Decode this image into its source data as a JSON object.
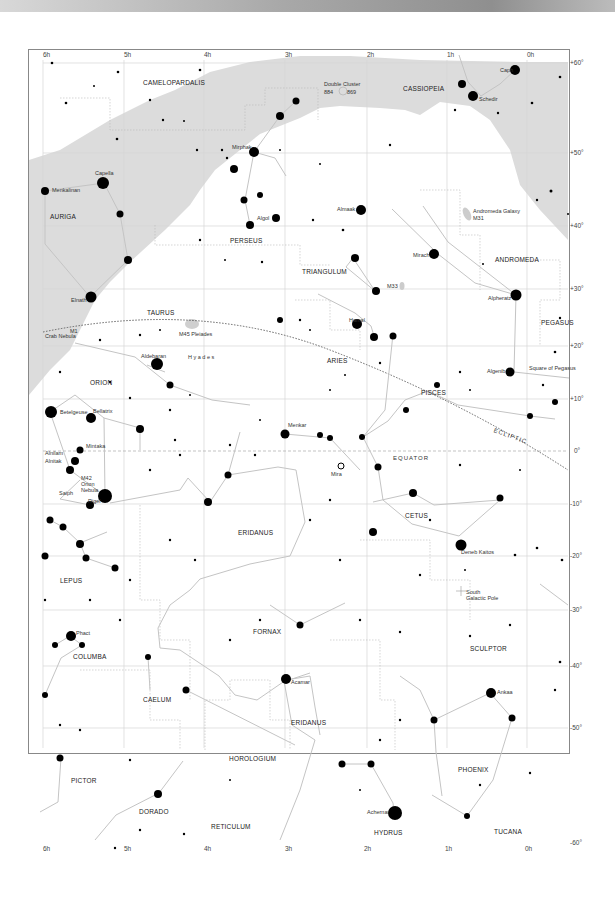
{
  "header": {
    "bar": ""
  },
  "ra_labels": [
    "6h",
    "5h",
    "4h",
    "3h",
    "2h",
    "1h",
    "0h"
  ],
  "dec_labels": [
    "+60°",
    "+50°",
    "+40°",
    "+30°",
    "+20°",
    "+10°",
    "0°",
    "-10°",
    "-20°",
    "-30°",
    "-40°",
    "-50°",
    "-60°"
  ],
  "constellations": {
    "camelopardalis": "CAMELOPARDALIS",
    "cassiopeia": "CASSIOPEIA",
    "auriga": "AURIGA",
    "perseus": "PERSEUS",
    "triangulum": "TRIANGULUM",
    "andromeda": "ANDROMEDA",
    "pegasus": "PEGASUS",
    "taurus": "TAURUS",
    "aries": "ARIES",
    "pisces": "PISCES",
    "orion": "ORION",
    "cetus": "CETUS",
    "eridanus_n": "ERIDANUS",
    "lepus": "LEPUS",
    "fornax": "FORNAX",
    "sculptor": "SCULPTOR",
    "columba": "COLUMBA",
    "caelum": "CAELUM",
    "eridanus_s": "ERIDANUS",
    "phoenix": "PHOENIX",
    "horologium": "HOROLOGIUM",
    "pictor": "PICTOR",
    "dorado": "DORADO",
    "reticulum": "RETICULUM",
    "hydrus": "HYDRUS",
    "tucana": "TUCANA"
  },
  "stars": {
    "capella": "Capella",
    "menkalinan": "Menkalinan",
    "mirphak": "Mirphak",
    "algol": "Algol",
    "almaak": "Almaak",
    "mirach": "Mirach",
    "alpheratz": "Alpheratz",
    "algenib": "Algenib",
    "caph": "Caph",
    "schedir": "Schedir",
    "elnath": "Elnath",
    "aldebaran": "Aldebaran",
    "hamal": "Hamal",
    "menkar": "Menkar",
    "mira": "Mira",
    "betelgeuse": "Betelgeuse",
    "bellatrix": "Bellatrix",
    "mintaka": "Mintaka",
    "alnilam": "Alnilam",
    "alnitak": "Alnitak",
    "saiph": "Saiph",
    "rigel": "Rigel",
    "deneb_kaitos": "Deneb Kaitos",
    "phact": "Phact",
    "acamar": "Acamar",
    "ankaa": "Ankaa",
    "achernar": "Achernar"
  },
  "objects": {
    "double_cluster": "Double Cluster",
    "ngc884": "884",
    "ngc869": "869",
    "andromeda_galaxy": "Andromeda Galaxy",
    "m31": "M31",
    "m33": "M33",
    "m45": "M45 Pleiades",
    "hyades": "H y a d e s",
    "crab_nebula": "Crab Nebula",
    "m1": "M1",
    "m42": "M42",
    "orion_nebula_1": "Orion",
    "orion_nebula_2": "Nebula",
    "square_of_pegasus": "Square of Pegasus",
    "south_galactic_pole_1": "South",
    "south_galactic_pole_2": "Galactic Pole"
  },
  "lines": {
    "ecliptic": "ECLIPTIC",
    "equator": "EQUATOR"
  },
  "colors": {
    "milky_way": "#dcdcdc",
    "grid": "#d0d0d0",
    "stick": "#c4c4c4",
    "star": "#000000",
    "frame": "#888888"
  }
}
